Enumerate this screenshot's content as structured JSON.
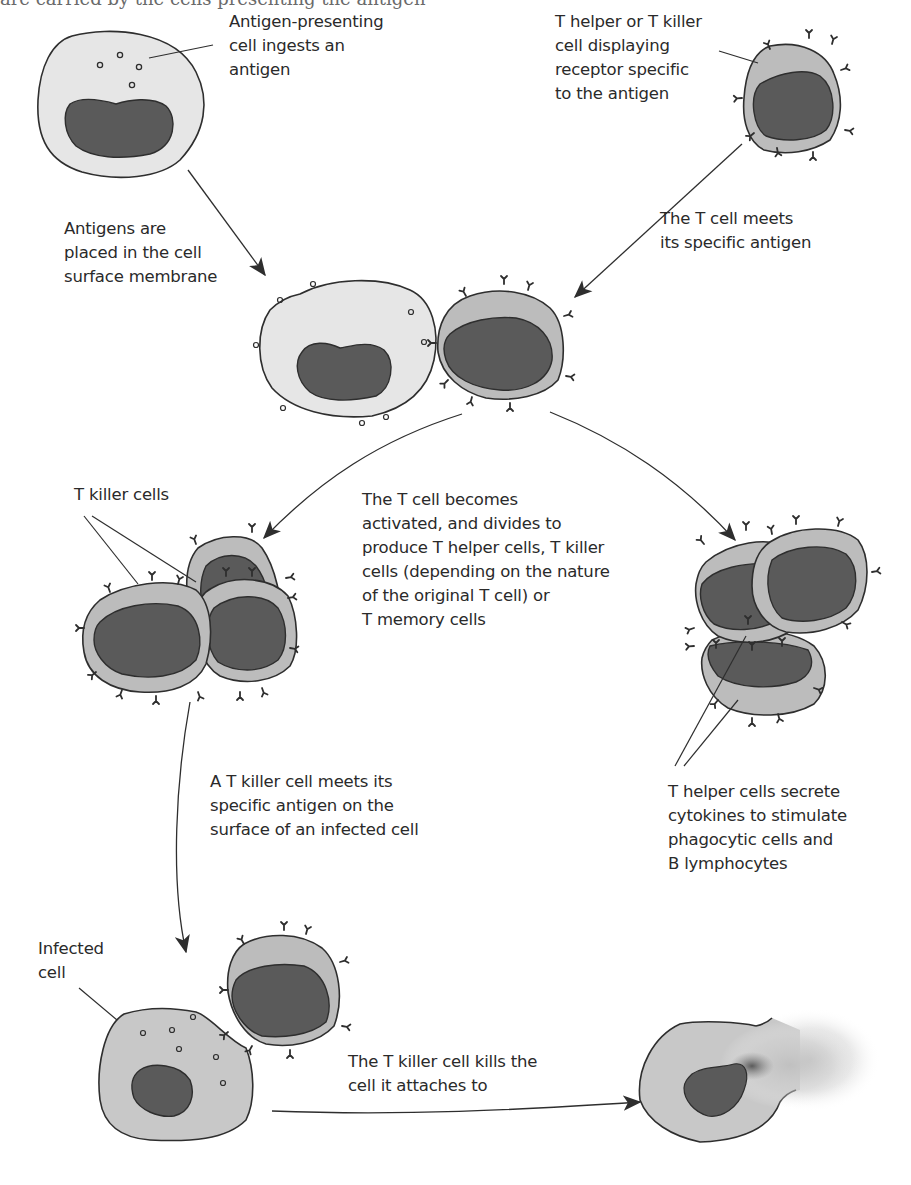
{
  "figure": {
    "cutoff_caption": "are carried by the cells presenting the antigen",
    "colors": {
      "background": "#ffffff",
      "apc_cytoplasm": "#e6e6e6",
      "tcell_cytoplasm": "#bcbcbc",
      "infected_cytoplasm": "#c8c8c8",
      "nucleus": "#5a5a5a",
      "outline": "#2e2e2e",
      "text": "#2a2a2a"
    },
    "labels": {
      "apc": [
        "Antigen-presenting",
        "cell ingests an",
        "antigen"
      ],
      "tcell": [
        "T helper or T killer",
        "cell displaying",
        "receptor specific",
        "to the antigen"
      ],
      "placed": [
        "Antigens are",
        "placed in the cell",
        "surface membrane"
      ],
      "meets": [
        "The T cell meets",
        "its specific antigen"
      ],
      "killer_cells": [
        "T killer cells"
      ],
      "activated": [
        "The T cell becomes",
        "activated, and divides to",
        "produce T helper cells, T killer",
        "cells (depending on the nature",
        "of the original T cell) or",
        "T memory cells"
      ],
      "killer_meets": [
        "A T killer cell meets its",
        "specific antigen on the",
        "surface of an infected cell"
      ],
      "helper_secrete": [
        "T helper cells secrete",
        "cytokines to stimulate",
        "phagocytic cells and",
        "B lymphocytes"
      ],
      "infected": [
        "Infected",
        "cell"
      ],
      "kills": [
        "The T killer cell kills the",
        "cell it attaches to"
      ]
    },
    "stages": [
      {
        "id": "apc-ingests",
        "description": "Antigen-presenting cell with ingested antigens"
      },
      {
        "id": "tcell-receptor",
        "description": "T cell displaying receptors"
      },
      {
        "id": "presentation",
        "description": "APC presents antigen to T cell"
      },
      {
        "id": "killer-clones",
        "description": "T killer cells"
      },
      {
        "id": "helper-clones",
        "description": "T helper cells"
      },
      {
        "id": "infected-contact",
        "description": "T killer cell attaches to infected cell"
      },
      {
        "id": "lysed-cell",
        "description": "Infected cell killed"
      }
    ]
  }
}
